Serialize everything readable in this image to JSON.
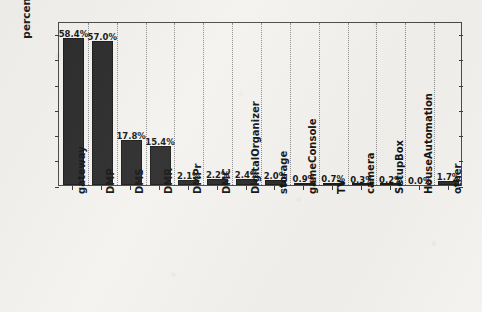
{
  "chart_data": {
    "type": "bar",
    "title": "",
    "xlabel": "",
    "ylabel": "percentage of homes (%)",
    "ylim": [
      0,
      65
    ],
    "yticks": [
      0,
      10,
      20,
      30,
      40,
      50,
      60
    ],
    "ytick_labels": [
      "0",
      "10",
      "20",
      "30",
      "40",
      "50",
      "60"
    ],
    "grid": "vertical-dotted",
    "legend": "none",
    "bar_color": "#2b2b2b",
    "categories": [
      "gateway",
      "DMP",
      "DMS",
      "DMR",
      "DMPr",
      "DMC",
      "DigitalOrganizer",
      "storage",
      "gameConsole",
      "TV",
      "camera",
      "SetupBox",
      "HouseAutomation",
      "other"
    ],
    "values": [
      58.4,
      57.0,
      17.8,
      15.4,
      2.1,
      2.2,
      2.4,
      2.0,
      0.9,
      0.7,
      0.3,
      0.2,
      0.0,
      1.7
    ],
    "value_labels": [
      "58.4%",
      "57.0%",
      "17.8%",
      "15.4%",
      "2.1%",
      "2.2%",
      "2.4%",
      "2.0%",
      "0.9%",
      "0.7%",
      "0.3%",
      "0.2%",
      "0.0%",
      "1.7%"
    ]
  }
}
